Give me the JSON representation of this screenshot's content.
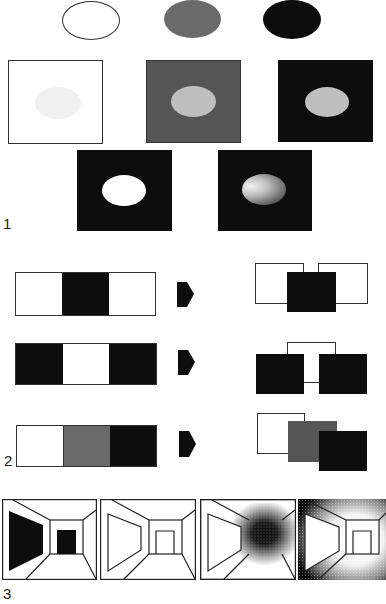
{
  "figure": {
    "labels": {
      "fig1": "1",
      "fig2": "2",
      "fig3": "3"
    },
    "fig1": {
      "description": "Lightness contrast: same ellipse on white, gray and black surrounds",
      "top_row": [
        "outline-ellipse",
        "gray-ellipse",
        "black-ellipse"
      ],
      "middle_row": [
        "light-ellipse-on-white",
        "light-ellipse-on-gray",
        "light-ellipse-on-black"
      ],
      "bottom_row": [
        "white-ellipse-on-black",
        "shaded-ellipse-on-black"
      ]
    },
    "fig2": {
      "description": "Figure-ground strips with arrows to interpreted layered squares",
      "rows": [
        {
          "strip": [
            "white",
            "black",
            "white"
          ],
          "arrow": "right-arrow",
          "result": "black square in front of two white squares"
        },
        {
          "strip": [
            "black",
            "white",
            "black"
          ],
          "arrow": "right-arrow",
          "result": "two black squares in front of white square"
        },
        {
          "strip": [
            "white",
            "gray",
            "black"
          ],
          "arrow": "right-arrow",
          "result": "white, gray, black squares stacked front to back"
        }
      ]
    },
    "fig3": {
      "description": "Corridor perspective drawings with varying shading",
      "panels": [
        "corridor-black-window-door",
        "corridor-outline",
        "corridor-dark-center",
        "corridor-dark-edges"
      ]
    }
  },
  "colors": {
    "black": "#0d0d0d",
    "gray": "#aaaaaa",
    "white": "#ffffff",
    "line": "#333333"
  }
}
